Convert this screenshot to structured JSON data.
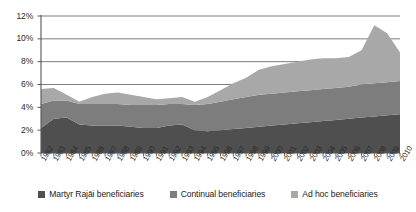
{
  "chart_data": {
    "type": "area",
    "stacked": true,
    "title": "",
    "xlabel": "",
    "ylabel": "",
    "ylim": [
      0,
      12
    ],
    "ytick_labels": [
      "0%",
      "2%",
      "4%",
      "6%",
      "8%",
      "10%",
      "12%"
    ],
    "ytick_values": [
      0,
      2,
      4,
      6,
      8,
      10,
      12
    ],
    "grid": true,
    "grid_axis": "y",
    "legend_position": "bottom",
    "categories": [
      "1982",
      "1983",
      "1984",
      "1985",
      "1986",
      "1987",
      "1988",
      "1989",
      "1990",
      "1991",
      "1992",
      "1993",
      "1994",
      "1995",
      "1996",
      "1997",
      "1998",
      "1999",
      "2000",
      "2001",
      "2002",
      "2003",
      "2004",
      "2005",
      "2006",
      "2007",
      "2008",
      "2009",
      "2010"
    ],
    "series": [
      {
        "name": "Martyr Rajāi beneficiaries",
        "color": "#4f4f4f",
        "values": [
          2.2,
          3.0,
          3.1,
          2.5,
          2.4,
          2.4,
          2.4,
          2.3,
          2.2,
          2.2,
          2.4,
          2.5,
          2.0,
          1.9,
          2.0,
          2.1,
          2.2,
          2.3,
          2.4,
          2.5,
          2.6,
          2.7,
          2.8,
          2.9,
          3.0,
          3.1,
          3.2,
          3.3,
          3.4
        ]
      },
      {
        "name": "Continual beneficiaries",
        "color": "#7d7d7d",
        "values": [
          2.1,
          1.6,
          1.5,
          1.8,
          1.9,
          1.9,
          1.9,
          1.9,
          2.0,
          2.0,
          1.9,
          1.8,
          2.2,
          2.4,
          2.5,
          2.6,
          2.7,
          2.8,
          2.8,
          2.8,
          2.8,
          2.8,
          2.8,
          2.8,
          2.8,
          2.9,
          2.9,
          2.9,
          2.9
        ]
      },
      {
        "name": "Ad hoc beneficiaries",
        "color": "#a8a8a8",
        "values": [
          1.3,
          1.1,
          0.5,
          0.2,
          0.6,
          0.9,
          1.0,
          0.9,
          0.7,
          0.5,
          0.5,
          0.6,
          0.3,
          0.6,
          1.0,
          1.4,
          1.7,
          2.2,
          2.4,
          2.5,
          2.6,
          2.7,
          2.7,
          2.6,
          2.6,
          3.0,
          5.1,
          4.3,
          2.5
        ]
      }
    ],
    "totals": [
      5.6,
      5.7,
      5.1,
      4.5,
      4.9,
      5.2,
      5.3,
      5.1,
      4.9,
      4.7,
      4.8,
      4.9,
      4.5,
      4.9,
      5.5,
      6.1,
      6.6,
      7.3,
      7.6,
      7.8,
      8.0,
      8.2,
      8.3,
      8.3,
      8.4,
      9.0,
      11.2,
      10.5,
      8.8
    ]
  },
  "legend": {
    "items": [
      {
        "label": "Martyr Rajāi beneficiaries",
        "color": "#4f4f4f"
      },
      {
        "label": "Continual beneficiaries",
        "color": "#7d7d7d"
      },
      {
        "label": "Ad hoc beneficiaries",
        "color": "#a8a8a8"
      }
    ]
  },
  "axes": {
    "axis_color": "#555555",
    "grid_color": "#6e6e6e",
    "plot_left": 41,
    "plot_right": 400,
    "plot_top": 16,
    "plot_bottom": 153
  }
}
